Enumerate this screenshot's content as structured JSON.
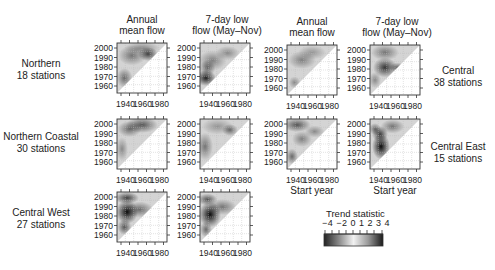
{
  "figure": {
    "column_headers": [
      {
        "line1": "Annual",
        "line2": "mean flow"
      },
      {
        "line1": "7-day low",
        "line2": "flow (May–Nov)"
      },
      {
        "line1": "Annual",
        "line2": "mean flow"
      },
      {
        "line1": "7-day low",
        "line2": "flow (May–Nov)"
      }
    ],
    "row_labels": [
      {
        "line1": "Northern",
        "line2": "18 stations"
      },
      {
        "line1": "Northern Coastal",
        "line2": "30 stations"
      },
      {
        "line1": "Central West",
        "line2": "27 stations"
      },
      {
        "line1": "Central",
        "line2": "38 stations"
      },
      {
        "line1": "Central East",
        "line2": "15 stations"
      }
    ],
    "x_axis_label": "Start year",
    "colorbar": {
      "title": "Trend statistic",
      "tick_labels": "−4 −2 0 1 2 3 4"
    }
  },
  "chart_data": {
    "type": "heatmap",
    "title": "",
    "xlabel": "Start year",
    "ylabel": "End year",
    "x_ticks": [
      "1940",
      "1960",
      "1980"
    ],
    "y_ticks": [
      "2000",
      "1990",
      "1980",
      "1970",
      "1960"
    ],
    "xlim": [
      1930,
      1985
    ],
    "ylim": [
      1950,
      2005
    ],
    "colorbar": {
      "label": "Trend statistic",
      "ticks": [
        -4,
        -2,
        0,
        1,
        2,
        3,
        4
      ],
      "range": [
        -4,
        4
      ]
    },
    "panels": [
      {
        "region": "Northern",
        "stations": 18,
        "variable": "Annual mean flow",
        "note": "moderately negative trends in upper triangle, strongest near start 1965 / end 1988"
      },
      {
        "region": "Northern",
        "stations": 18,
        "variable": "7-day low flow (May–Nov)",
        "note": "strongest negative trends near start 1935 / end 1965"
      },
      {
        "region": "Northern Coastal",
        "stations": 30,
        "variable": "Annual mean flow",
        "note": "negative trends concentrated for end years 1990–2005"
      },
      {
        "region": "Northern Coastal",
        "stations": 30,
        "variable": "7-day low flow (May–Nov)",
        "note": "weak to moderate negative trends"
      },
      {
        "region": "Central West",
        "stations": 27,
        "variable": "Annual mean flow",
        "note": "strong negative trends near start 1942 / end 1980–1985"
      },
      {
        "region": "Central West",
        "stations": 27,
        "variable": "7-day low flow (May–Nov)",
        "note": "strong negative trends near start 1942 / end 1975–1985"
      },
      {
        "region": "Central",
        "stations": 38,
        "variable": "Annual mean flow",
        "note": "light negative trends, mostly end years 1980–2000"
      },
      {
        "region": "Central",
        "stations": 38,
        "variable": "7-day low flow (May–Nov)",
        "note": "moderate negative trends near start 1945 / end 1980"
      },
      {
        "region": "Central East",
        "stations": 15,
        "variable": "Annual mean flow",
        "note": "moderate negative trends in upper region"
      },
      {
        "region": "Central East",
        "stations": 15,
        "variable": "7-day low flow (May–Nov)",
        "note": "strong negative trends near start 1945 / end 1970–1980"
      }
    ]
  }
}
